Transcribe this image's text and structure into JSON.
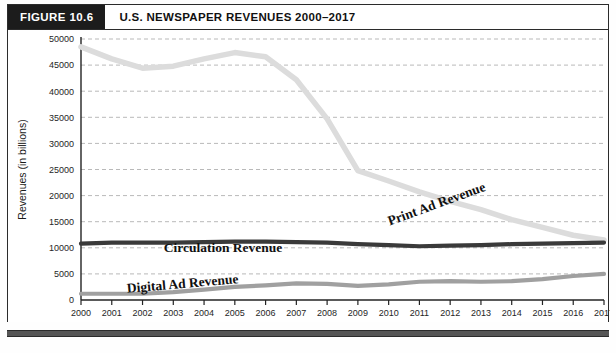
{
  "figure": {
    "badge": "FIGURE 10.6",
    "title": "U.S. NEWSPAPER REVENUES 2000–2017",
    "footer_note": ""
  },
  "chart_data": {
    "type": "line",
    "title": "U.S. NEWSPAPER REVENUES 2000–2017",
    "xlabel": "",
    "ylabel": "Revenues (in billions)",
    "x": [
      2000,
      2001,
      2002,
      2003,
      2004,
      2005,
      2006,
      2007,
      2008,
      2009,
      2010,
      2011,
      2012,
      2013,
      2014,
      2015,
      2016,
      2017
    ],
    "categories": [
      "2000",
      "2001",
      "2002",
      "2003",
      "2004",
      "2005",
      "2006",
      "2007",
      "2008",
      "2009",
      "2010",
      "2011",
      "2012",
      "2013",
      "2014",
      "2015",
      "2016",
      "2017"
    ],
    "xlim": [
      2000,
      2017
    ],
    "ylim": [
      0,
      50000
    ],
    "yticks": [
      0,
      5000,
      10000,
      15000,
      20000,
      25000,
      30000,
      35000,
      40000,
      45000,
      50000
    ],
    "ytick_labels": [
      "0",
      "5000",
      "10000",
      "15000",
      "20000",
      "25000",
      "30000",
      "35000",
      "40000",
      "45000",
      "50000"
    ],
    "grid": true,
    "grid_style": "dashed-horizontal",
    "legend": "inline-labels",
    "series": [
      {
        "name": "Print Ad Revenue",
        "color": "#dcdcdc",
        "label_rotation": -20,
        "values": [
          48500,
          46200,
          44400,
          44800,
          46200,
          47400,
          46600,
          42200,
          34700,
          24800,
          22800,
          20700,
          18900,
          17300,
          15400,
          13900,
          12400,
          11500
        ]
      },
      {
        "name": "Circulation Revenue",
        "color": "#3a3a3a",
        "label_rotation": 0,
        "values": [
          10800,
          11000,
          11000,
          11000,
          11100,
          11200,
          11200,
          11100,
          11000,
          10700,
          10500,
          10300,
          10400,
          10500,
          10700,
          10800,
          10900,
          11000
        ]
      },
      {
        "name": "Digital Ad Revenue",
        "color": "#a0a0a0",
        "label_rotation": -6,
        "values": [
          1200,
          1200,
          1200,
          1500,
          2000,
          2500,
          2800,
          3200,
          3100,
          2700,
          3000,
          3500,
          3600,
          3500,
          3600,
          4000,
          4600,
          5000
        ]
      }
    ]
  }
}
